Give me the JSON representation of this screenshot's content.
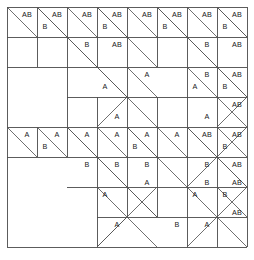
{
  "figure": {
    "colors": {
      "background": "#ffffff",
      "grid_line": "#4a4a4a",
      "diagonal_line": "#555555",
      "outer_border": "#2b2b2b",
      "label_text": "#1a1a1a"
    },
    "geometry": {
      "origin_x": 7,
      "origin_y": 7,
      "cell": 30,
      "cols": 8,
      "rows": 8,
      "width": 240,
      "height": 240
    },
    "labels": {
      "a": "A",
      "b": "B",
      "ab": "AB"
    },
    "grid_vertical_x": [
      7,
      37,
      67,
      97,
      127,
      157,
      187,
      217,
      247
    ],
    "grid_horizontal_y": [
      7,
      37,
      67,
      97,
      127,
      157,
      187,
      217,
      247
    ],
    "cell_marks": [
      {
        "row": 0,
        "col": 0,
        "text": "AB",
        "x": 27,
        "y": 15
      },
      {
        "row": 0,
        "col": 1,
        "text": "AB",
        "x": 57,
        "y": 15
      },
      {
        "row": 0,
        "col": 1,
        "text": "B",
        "x": 45,
        "y": 27
      },
      {
        "row": 0,
        "col": 2,
        "text": "AB",
        "x": 87,
        "y": 15
      },
      {
        "row": 0,
        "col": 3,
        "text": "AB",
        "x": 117,
        "y": 15
      },
      {
        "row": 0,
        "col": 3,
        "text": "B",
        "x": 105,
        "y": 27
      },
      {
        "row": 0,
        "col": 4,
        "text": "AB",
        "x": 147,
        "y": 15
      },
      {
        "row": 0,
        "col": 5,
        "text": "AB",
        "x": 177,
        "y": 15
      },
      {
        "row": 0,
        "col": 5,
        "text": "B",
        "x": 165,
        "y": 27
      },
      {
        "row": 0,
        "col": 6,
        "text": "AB",
        "x": 207,
        "y": 15
      },
      {
        "row": 0,
        "col": 7,
        "text": "AB",
        "x": 237,
        "y": 15
      },
      {
        "row": 0,
        "col": 7,
        "text": "B",
        "x": 225,
        "y": 27
      },
      {
        "row": 1,
        "col": 2,
        "text": "B",
        "x": 87,
        "y": 45
      },
      {
        "row": 1,
        "col": 3,
        "text": "AB",
        "x": 117,
        "y": 45
      },
      {
        "row": 1,
        "col": 6,
        "text": "B",
        "x": 207,
        "y": 45
      },
      {
        "row": 1,
        "col": 7,
        "text": "AB",
        "x": 237,
        "y": 45
      },
      {
        "row": 2,
        "col": 3,
        "text": "A",
        "x": 105,
        "y": 87
      },
      {
        "row": 2,
        "col": 4,
        "text": "A",
        "x": 147,
        "y": 75
      },
      {
        "row": 2,
        "col": 6,
        "text": "B",
        "x": 207,
        "y": 75
      },
      {
        "row": 2,
        "col": 6,
        "text": "A",
        "x": 195,
        "y": 87
      },
      {
        "row": 2,
        "col": 7,
        "text": "AB",
        "x": 237,
        "y": 75
      },
      {
        "row": 2,
        "col": 7,
        "text": "B",
        "x": 225,
        "y": 87
      },
      {
        "row": 3,
        "col": 3,
        "text": "A",
        "x": 117,
        "y": 117
      },
      {
        "row": 3,
        "col": 7,
        "text": "AB",
        "x": 237,
        "y": 105
      },
      {
        "row": 3,
        "col": 6,
        "text": "A",
        "x": 207,
        "y": 117
      },
      {
        "row": 4,
        "col": 0,
        "text": "A",
        "x": 27,
        "y": 135
      },
      {
        "row": 4,
        "col": 1,
        "text": "A",
        "x": 57,
        "y": 135
      },
      {
        "row": 4,
        "col": 1,
        "text": "B",
        "x": 45,
        "y": 147
      },
      {
        "row": 4,
        "col": 2,
        "text": "A",
        "x": 87,
        "y": 135
      },
      {
        "row": 4,
        "col": 3,
        "text": "A",
        "x": 117,
        "y": 135
      },
      {
        "row": 4,
        "col": 4,
        "text": "A",
        "x": 147,
        "y": 135
      },
      {
        "row": 4,
        "col": 4,
        "text": "B",
        "x": 135,
        "y": 147
      },
      {
        "row": 4,
        "col": 5,
        "text": "A",
        "x": 177,
        "y": 135
      },
      {
        "row": 4,
        "col": 6,
        "text": "AB",
        "x": 207,
        "y": 135
      },
      {
        "row": 4,
        "col": 7,
        "text": "AB",
        "x": 237,
        "y": 135
      },
      {
        "row": 4,
        "col": 7,
        "text": "B",
        "x": 225,
        "y": 147
      },
      {
        "row": 5,
        "col": 2,
        "text": "B",
        "x": 87,
        "y": 165
      },
      {
        "row": 5,
        "col": 3,
        "text": "B",
        "x": 117,
        "y": 165
      },
      {
        "row": 5,
        "col": 4,
        "text": "B",
        "x": 147,
        "y": 165
      },
      {
        "row": 5,
        "col": 6,
        "text": "B",
        "x": 207,
        "y": 165
      },
      {
        "row": 5,
        "col": 7,
        "text": "AB",
        "x": 237,
        "y": 165
      },
      {
        "row": 6,
        "col": 3,
        "text": "A",
        "x": 105,
        "y": 195
      },
      {
        "row": 6,
        "col": 4,
        "text": "A",
        "x": 147,
        "y": 183
      },
      {
        "row": 6,
        "col": 6,
        "text": "B",
        "x": 207,
        "y": 183
      },
      {
        "row": 6,
        "col": 6,
        "text": "A",
        "x": 195,
        "y": 195
      },
      {
        "row": 6,
        "col": 7,
        "text": "AB",
        "x": 237,
        "y": 183
      },
      {
        "row": 6,
        "col": 7,
        "text": "B",
        "x": 225,
        "y": 195
      },
      {
        "row": 7,
        "col": 3,
        "text": "A",
        "x": 117,
        "y": 225
      },
      {
        "row": 7,
        "col": 5,
        "text": "B",
        "x": 177,
        "y": 225
      },
      {
        "row": 7,
        "col": 6,
        "text": "A",
        "x": 207,
        "y": 225
      },
      {
        "row": 7,
        "col": 7,
        "text": "AB",
        "x": 237,
        "y": 213
      }
    ],
    "diagonals": [
      {
        "x1": 7,
        "y1": 7,
        "x2": 37,
        "y2": 37
      },
      {
        "x1": 37,
        "y1": 7,
        "x2": 67,
        "y2": 37
      },
      {
        "x1": 67,
        "y1": 7,
        "x2": 97,
        "y2": 37
      },
      {
        "x1": 97,
        "y1": 7,
        "x2": 127,
        "y2": 37
      },
      {
        "x1": 127,
        "y1": 7,
        "x2": 157,
        "y2": 37
      },
      {
        "x1": 157,
        "y1": 7,
        "x2": 187,
        "y2": 37
      },
      {
        "x1": 187,
        "y1": 7,
        "x2": 217,
        "y2": 37
      },
      {
        "x1": 217,
        "y1": 7,
        "x2": 247,
        "y2": 37
      },
      {
        "x1": 37,
        "y1": 7,
        "x2": 97,
        "y2": 67
      },
      {
        "x1": 97,
        "y1": 7,
        "x2": 157,
        "y2": 67
      },
      {
        "x1": 157,
        "y1": 7,
        "x2": 217,
        "y2": 67
      },
      {
        "x1": 217,
        "y1": 7,
        "x2": 247,
        "y2": 37
      },
      {
        "x1": 187,
        "y1": 37,
        "x2": 247,
        "y2": 97
      },
      {
        "x1": 67,
        "y1": 37,
        "x2": 127,
        "y2": 97
      },
      {
        "x1": 97,
        "y1": 67,
        "x2": 127,
        "y2": 97
      },
      {
        "x1": 127,
        "y1": 67,
        "x2": 157,
        "y2": 97
      },
      {
        "x1": 217,
        "y1": 67,
        "x2": 247,
        "y2": 97
      },
      {
        "x1": 187,
        "y1": 67,
        "x2": 217,
        "y2": 97
      },
      {
        "x1": 127,
        "y1": 97,
        "x2": 97,
        "y2": 127
      },
      {
        "x1": 127,
        "y1": 97,
        "x2": 157,
        "y2": 127
      },
      {
        "x1": 247,
        "y1": 97,
        "x2": 217,
        "y2": 127
      },
      {
        "x1": 217,
        "y1": 97,
        "x2": 247,
        "y2": 127
      },
      {
        "x1": 7,
        "y1": 127,
        "x2": 37,
        "y2": 157
      },
      {
        "x1": 37,
        "y1": 127,
        "x2": 67,
        "y2": 157
      },
      {
        "x1": 67,
        "y1": 127,
        "x2": 97,
        "y2": 157
      },
      {
        "x1": 97,
        "y1": 127,
        "x2": 127,
        "y2": 157
      },
      {
        "x1": 127,
        "y1": 127,
        "x2": 157,
        "y2": 157
      },
      {
        "x1": 157,
        "y1": 127,
        "x2": 187,
        "y2": 157
      },
      {
        "x1": 187,
        "y1": 127,
        "x2": 217,
        "y2": 157
      },
      {
        "x1": 217,
        "y1": 127,
        "x2": 247,
        "y2": 157
      },
      {
        "x1": 67,
        "y1": 127,
        "x2": 127,
        "y2": 187
      },
      {
        "x1": 127,
        "y1": 127,
        "x2": 187,
        "y2": 187
      },
      {
        "x1": 187,
        "y1": 127,
        "x2": 247,
        "y2": 187
      },
      {
        "x1": 97,
        "y1": 157,
        "x2": 157,
        "y2": 217
      },
      {
        "x1": 217,
        "y1": 157,
        "x2": 247,
        "y2": 187
      },
      {
        "x1": 97,
        "y1": 187,
        "x2": 127,
        "y2": 217
      },
      {
        "x1": 127,
        "y1": 187,
        "x2": 157,
        "y2": 217
      },
      {
        "x1": 187,
        "y1": 187,
        "x2": 217,
        "y2": 217
      },
      {
        "x1": 217,
        "y1": 187,
        "x2": 247,
        "y2": 217
      },
      {
        "x1": 127,
        "y1": 217,
        "x2": 97,
        "y2": 247
      },
      {
        "x1": 127,
        "y1": 217,
        "x2": 157,
        "y2": 247
      },
      {
        "x1": 217,
        "y1": 217,
        "x2": 187,
        "y2": 247
      },
      {
        "x1": 217,
        "y1": 217,
        "x2": 247,
        "y2": 247
      },
      {
        "x1": 247,
        "y1": 127,
        "x2": 187,
        "y2": 187
      },
      {
        "x1": 247,
        "y1": 187,
        "x2": 217,
        "y2": 217
      },
      {
        "x1": 157,
        "y1": 187,
        "x2": 97,
        "y2": 247
      }
    ],
    "grid_segments": [
      {
        "x1": 7,
        "y1": 7,
        "x2": 247,
        "y2": 7
      },
      {
        "x1": 7,
        "y1": 247,
        "x2": 247,
        "y2": 247
      },
      {
        "x1": 7,
        "y1": 7,
        "x2": 7,
        "y2": 247
      },
      {
        "x1": 247,
        "y1": 7,
        "x2": 247,
        "y2": 247
      },
      {
        "x1": 7,
        "y1": 37,
        "x2": 247,
        "y2": 37
      },
      {
        "x1": 7,
        "y1": 67,
        "x2": 247,
        "y2": 67
      },
      {
        "x1": 67,
        "y1": 97,
        "x2": 247,
        "y2": 97
      },
      {
        "x1": 7,
        "y1": 127,
        "x2": 247,
        "y2": 127
      },
      {
        "x1": 7,
        "y1": 157,
        "x2": 247,
        "y2": 157
      },
      {
        "x1": 67,
        "y1": 187,
        "x2": 247,
        "y2": 187
      },
      {
        "x1": 97,
        "y1": 217,
        "x2": 247,
        "y2": 217
      },
      {
        "x1": 37,
        "y1": 7,
        "x2": 37,
        "y2": 67
      },
      {
        "x1": 67,
        "y1": 7,
        "x2": 67,
        "y2": 127
      },
      {
        "x1": 97,
        "y1": 7,
        "x2": 97,
        "y2": 67
      },
      {
        "x1": 97,
        "y1": 97,
        "x2": 97,
        "y2": 127
      },
      {
        "x1": 127,
        "y1": 7,
        "x2": 127,
        "y2": 127
      },
      {
        "x1": 157,
        "y1": 7,
        "x2": 157,
        "y2": 67
      },
      {
        "x1": 157,
        "y1": 97,
        "x2": 157,
        "y2": 127
      },
      {
        "x1": 187,
        "y1": 7,
        "x2": 187,
        "y2": 127
      },
      {
        "x1": 217,
        "y1": 7,
        "x2": 217,
        "y2": 127
      },
      {
        "x1": 37,
        "y1": 127,
        "x2": 37,
        "y2": 157
      },
      {
        "x1": 67,
        "y1": 127,
        "x2": 67,
        "y2": 157
      },
      {
        "x1": 97,
        "y1": 127,
        "x2": 97,
        "y2": 247
      },
      {
        "x1": 127,
        "y1": 127,
        "x2": 127,
        "y2": 187
      },
      {
        "x1": 127,
        "y1": 187,
        "x2": 127,
        "y2": 217
      },
      {
        "x1": 157,
        "y1": 127,
        "x2": 157,
        "y2": 157
      },
      {
        "x1": 157,
        "y1": 187,
        "x2": 157,
        "y2": 217
      },
      {
        "x1": 187,
        "y1": 127,
        "x2": 187,
        "y2": 247
      },
      {
        "x1": 217,
        "y1": 127,
        "x2": 217,
        "y2": 247
      },
      {
        "x1": 157,
        "y1": 157,
        "x2": 157,
        "y2": 187
      }
    ]
  }
}
